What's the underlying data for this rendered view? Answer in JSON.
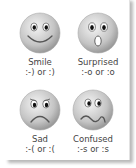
{
  "emoticons": [
    {
      "name": "Smile",
      "code": ":-) or :)",
      "icon": "smile-face-icon"
    },
    {
      "name": "Surprised",
      "code": ":-o or :o",
      "icon": "surprised-face-icon"
    },
    {
      "name": "Sad",
      "code": ":-( or :(",
      "icon": "sad-face-icon"
    },
    {
      "name": "Confused",
      "code": ":-s or :s",
      "icon": "confused-face-icon"
    }
  ],
  "colors": {
    "face_light": "#f2f2f2",
    "face_dark": "#9a9a9a",
    "text": "#444444"
  }
}
